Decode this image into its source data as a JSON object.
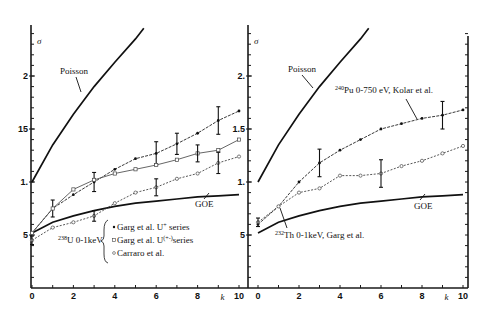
{
  "chart_data": [
    {
      "type": "line",
      "panel": "left",
      "title": "",
      "xlabel": "k",
      "ylabel": "σ",
      "xlim": [
        0,
        10
      ],
      "ylim": [
        0,
        2.5
      ],
      "x_ticks": [
        "0",
        "2",
        "4",
        "6",
        "8",
        "10"
      ],
      "y_ticks": [
        ".5",
        "1.",
        "1.5",
        "2."
      ],
      "grid": false,
      "x": [
        0,
        1,
        2,
        3,
        4,
        5,
        6,
        7,
        8,
        9,
        10
      ],
      "series": [
        {
          "name": "Poisson",
          "style": "solid-thick",
          "x": [
            0,
            1,
            2,
            3,
            4,
            5,
            5.4
          ],
          "values": [
            1.0,
            1.35,
            1.64,
            1.9,
            2.13,
            2.35,
            2.45
          ]
        },
        {
          "name": "GOE",
          "style": "solid-thick",
          "x": [
            0,
            1,
            2,
            3,
            4,
            5,
            6,
            7,
            8,
            9,
            10
          ],
          "values": [
            0.52,
            0.62,
            0.68,
            0.73,
            0.77,
            0.8,
            0.82,
            0.84,
            0.86,
            0.87,
            0.88
          ]
        },
        {
          "name": "Garg et al. U+ series",
          "marker": "filled-dot",
          "values": [
            0.52,
            0.75,
            0.88,
            1.0,
            1.12,
            1.22,
            1.27,
            1.36,
            1.46,
            1.58,
            1.67
          ],
          "error_bars": {
            "1": 0.08,
            "3": 0.09,
            "6": 0.11,
            "7": 0.1,
            "9": 0.13
          }
        },
        {
          "name": "Garg et al. U(+-) series",
          "marker": "open-square",
          "values": [
            0.52,
            0.75,
            0.93,
            1.02,
            1.08,
            1.12,
            1.16,
            1.21,
            1.27,
            1.3,
            1.4
          ],
          "error_bars": {
            "8": 0.08
          }
        },
        {
          "name": "Carraro et al.",
          "marker": "open-circle",
          "values": [
            0.45,
            0.57,
            0.62,
            0.68,
            0.8,
            0.9,
            0.95,
            1.03,
            1.08,
            1.18,
            1.24
          ],
          "error_bars": {
            "0": 0.04,
            "3": 0.05,
            "6": 0.08,
            "9": 0.1
          }
        }
      ],
      "annotations": [
        "Poisson",
        "GOE",
        "238U 0-1keV"
      ],
      "legend": {
        "group_label": "238U 0-1keV",
        "entries": [
          "Garg et al. U+ series",
          "Garg et al. U(+-) series",
          "Carraro et al."
        ],
        "position": "lower-center"
      }
    },
    {
      "type": "line",
      "panel": "right",
      "title": "",
      "xlabel": "k",
      "ylabel": "σ",
      "xlim": [
        0,
        10
      ],
      "ylim": [
        0,
        2.5
      ],
      "x_ticks": [
        "0",
        "2",
        "4",
        "6",
        "8",
        "10"
      ],
      "y_ticks": [
        ".5",
        "1.",
        "1.5",
        "2."
      ],
      "grid": false,
      "x": [
        0,
        1,
        2,
        3,
        4,
        5,
        6,
        7,
        8,
        9,
        10
      ],
      "series": [
        {
          "name": "Poisson",
          "style": "solid-thick",
          "x": [
            0,
            1,
            2,
            3,
            4,
            5,
            5.4
          ],
          "values": [
            1.0,
            1.35,
            1.64,
            1.9,
            2.13,
            2.35,
            2.45
          ]
        },
        {
          "name": "GOE",
          "style": "solid-thick",
          "x": [
            0,
            1,
            2,
            3,
            4,
            5,
            6,
            7,
            8,
            9,
            10
          ],
          "values": [
            0.52,
            0.62,
            0.68,
            0.73,
            0.77,
            0.8,
            0.82,
            0.84,
            0.86,
            0.87,
            0.88
          ]
        },
        {
          "name": "240Pu 0-750 eV, Kolar et al.",
          "marker": "filled-dot",
          "values": [
            0.6,
            0.77,
            1.0,
            1.18,
            1.3,
            1.4,
            1.5,
            1.55,
            1.6,
            1.63,
            1.68
          ],
          "error_bars": {
            "3": 0.13,
            "9": 0.13
          }
        },
        {
          "name": "232Th 0-1keV, Garg et al.",
          "marker": "open-circle",
          "values": [
            0.62,
            0.77,
            0.9,
            0.94,
            1.06,
            1.06,
            1.08,
            1.15,
            1.2,
            1.27,
            1.34
          ],
          "error_bars": {
            "0": 0.04,
            "6": 0.13
          }
        }
      ],
      "annotations": [
        "Poisson",
        "240Pu 0-750 eV, Kolar et al.",
        "GOE",
        "232Th 0-1keV, Garg et al."
      ]
    }
  ],
  "labels": {
    "sigma": "σ",
    "k": "k",
    "poisson": "Poisson",
    "goe": "GOE",
    "left_group_mass": "238",
    "left_group_rest": "U 0-1keV",
    "legend_1_pre": "Garg et al.  U",
    "legend_1_sup": "+",
    "legend_1_post": " series",
    "legend_2_pre": "Garg et al.  U",
    "legend_2_sup": "(+-)",
    "legend_2_post": "series",
    "legend_3": "Carraro et al.",
    "pu_mass": "240",
    "pu_rest": "Pu  0-750 eV, Kolar et al.",
    "th_mass": "232",
    "th_rest": "Th  0-1keV, Garg et al."
  },
  "ticks": {
    "x": [
      "0",
      "2",
      "4",
      "6",
      "8",
      "10"
    ],
    "y": [
      ".5",
      "1.",
      "1.5",
      "2."
    ],
    "y_left": [
      "5",
      "1.",
      "15",
      "2"
    ],
    "y_right": [
      "5",
      "1.",
      "1.5",
      "2."
    ]
  }
}
